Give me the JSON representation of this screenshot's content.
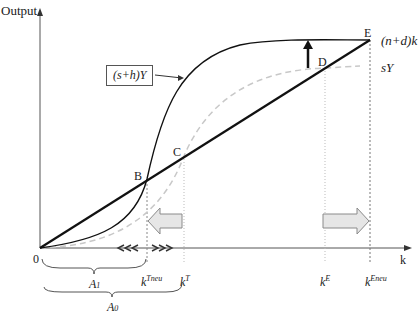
{
  "axes": {
    "y_label": "Output",
    "x_label": "k",
    "origin_label": "0"
  },
  "curves": {
    "investment_line": "(n+d)k",
    "total_savings": "(s+h)Y",
    "savings": "sY"
  },
  "points": {
    "B": "B",
    "C": "C",
    "D": "D",
    "E": "E"
  },
  "x_ticks": {
    "k_tneu_base": "k",
    "k_tneu_sup": "Tneu",
    "k_t_base": "k",
    "k_t_sup": "T",
    "k_e_base": "k",
    "k_e_sup": "E",
    "k_eneu_base": "k",
    "k_eneu_sup": "Eneu"
  },
  "brackets": {
    "a1": "A",
    "a1_sub": "1",
    "a0": "A",
    "a0_sub": "0"
  },
  "colors": {
    "line": "#111111",
    "dashed": "#c8c8c8",
    "arrow_fill": "#e6e6e6",
    "arrow_stroke": "#8a8a8a"
  }
}
